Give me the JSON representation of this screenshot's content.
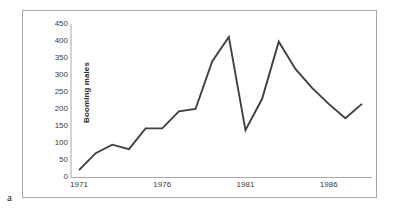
{
  "panel": {
    "label": "a"
  },
  "chart_data": {
    "type": "line",
    "title": "",
    "xlabel": "",
    "ylabel": "Booming males",
    "xlim": [
      1971,
      1988
    ],
    "ylim": [
      0,
      450
    ],
    "grid": false,
    "legend": null,
    "y_ticks": [
      450,
      400,
      350,
      300,
      250,
      200,
      150,
      100,
      50,
      0
    ],
    "x_ticks": [
      1971,
      1976,
      1981,
      1986
    ],
    "line_color": "#404040",
    "x": [
      1971,
      1972,
      1973,
      1974,
      1975,
      1976,
      1977,
      1978,
      1979,
      1980,
      1981,
      1982,
      1983,
      1984,
      1985,
      1986,
      1987,
      1988
    ],
    "values": [
      20,
      70,
      95,
      82,
      143,
      143,
      193,
      200,
      340,
      412,
      138,
      230,
      398,
      318,
      262,
      215,
      173,
      215
    ],
    "series": [
      {
        "name": "Booming males",
        "values": [
          20,
          70,
          95,
          82,
          143,
          143,
          193,
          200,
          340,
          412,
          138,
          230,
          398,
          318,
          262,
          215,
          173,
          215
        ]
      }
    ]
  }
}
